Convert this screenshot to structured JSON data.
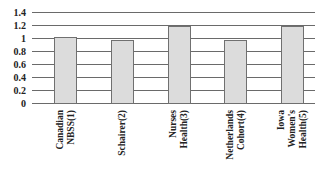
{
  "chart_data": {
    "type": "bar",
    "title": "",
    "xlabel": "",
    "ylabel": "",
    "categories": [
      [
        "Canadian",
        "NBSS(1)"
      ],
      [
        "Schairer(2)"
      ],
      [
        "Nurses",
        "Health(3)"
      ],
      [
        "Netherlands",
        "Cohort(4)"
      ],
      [
        "Iowa",
        "Women's",
        "Health(5)"
      ]
    ],
    "values": [
      1.01,
      0.97,
      1.19,
      0.97,
      1.18
    ],
    "ylim": [
      0,
      1.4
    ],
    "yticks": [
      "0",
      "0.2",
      "0.4",
      "0.6",
      "0.8",
      "1",
      "1.2",
      "1.4"
    ],
    "grid": true,
    "legend": null,
    "colors": {
      "bar_fill": "#dcdcdc",
      "bar_edge": "#707070",
      "grid": "#6a6a6a"
    }
  }
}
